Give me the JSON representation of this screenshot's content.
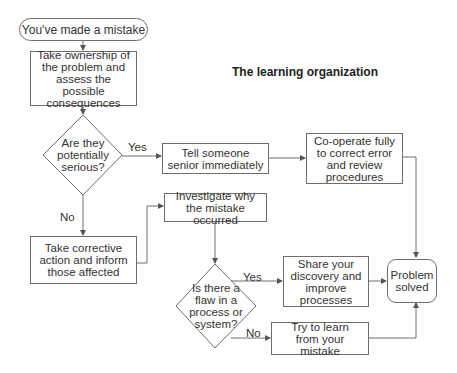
{
  "title": "The learning organization",
  "nodes": {
    "start": "You've made a mistake",
    "ownership": "Take ownership of the problem and assess the possible consequences",
    "serious_question": "Are they potentially serious?",
    "tell_senior": "Tell someone senior immediately",
    "cooperate": "Co-operate fully to correct error and review procedures",
    "corrective_action": "Take corrective action and inform those affected",
    "investigate": "Investigate why the mistake occurred",
    "flaw_question": "Is there a flaw in a process or system?",
    "share_discovery": "Share your discovery and improve processes",
    "learn": "Try to learn from your mistake",
    "end": "Problem solved"
  },
  "edge_labels": {
    "serious_yes": "Yes",
    "serious_no": "No",
    "flaw_yes": "Yes",
    "flaw_no": "No"
  },
  "colors": {
    "line": "#6e6e6e",
    "text": "#333333"
  }
}
